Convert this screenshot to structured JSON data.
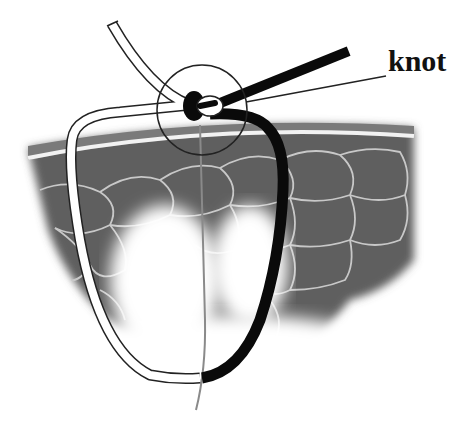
{
  "figure": {
    "labels": {
      "knot": "knot"
    },
    "elements": [
      "skin-surface-layer",
      "tissue-cells",
      "white-suture-strand",
      "black-suture-strand",
      "knot",
      "magnification-circle",
      "knot-leader-line",
      "thin-gray-thread"
    ],
    "colors": {
      "tissue": "#5f5f5f",
      "tissue_cell_border": "#c8c8c8",
      "skin_top": "#7a7a7a",
      "skin_highlight": "#f2f2f2",
      "black_strand": "#0a0a0a",
      "white_strand": "#ffffff",
      "outline": "#222222",
      "thread": "#8a8a8a",
      "label": "#111111"
    }
  }
}
